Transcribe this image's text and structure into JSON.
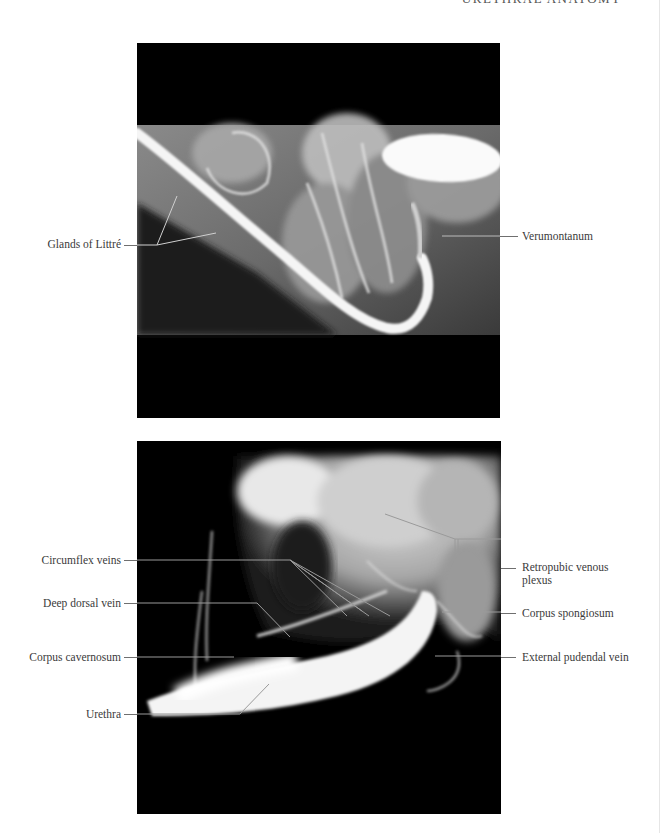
{
  "page": {
    "running_head": "URETHRAL ANATOMY"
  },
  "figures": [
    {
      "id": "top",
      "description": "Retrograde urethrogram",
      "labels": {
        "glands_of_littre": "Glands of Littré",
        "verumontanum": "Verumontanum"
      }
    },
    {
      "id": "bottom",
      "description": "Cavernosogram",
      "labels": {
        "circumflex_veins": "Circumflex veins",
        "deep_dorsal_vein": "Deep dorsal vein",
        "corpus_cavernosum": "Corpus cavernosum",
        "urethra": "Urethra",
        "retropubic_venous_plexus_line1": "Retropubic venous",
        "retropubic_venous_plexus_line2": "plexus",
        "corpus_spongiosum": "Corpus spongiosum",
        "external_pudendal_vein": "External pudendal vein"
      }
    }
  ]
}
